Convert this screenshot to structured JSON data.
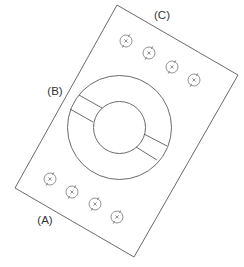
{
  "diagram": {
    "colors": {
      "line": "#5a5a5a",
      "label": "#333333",
      "background": "#ffffff"
    },
    "plate": {
      "corners": [
        [
          117,
          5
        ],
        [
          238,
          75
        ],
        [
          134,
          257
        ],
        [
          15,
          188
        ]
      ]
    },
    "ring": {
      "center": [
        119.5,
        127.5
      ],
      "outer_radius": 52,
      "inner_radius": 26,
      "slots": [
        {
          "side": "upper-left",
          "lines": [
            [
              [
                79,
                95
              ],
              [
                102,
                108
              ]
            ],
            [
              [
                70,
                109
              ],
              [
                93,
                122
              ]
            ]
          ]
        },
        {
          "side": "lower-right",
          "lines": [
            [
              [
                144,
                134
              ],
              [
                167,
                146
              ]
            ],
            [
              [
                136,
                147
              ],
              [
                157,
                160
              ]
            ]
          ]
        }
      ]
    },
    "fasteners": {
      "radius": 6,
      "row_c": [
        [
          126,
          41
        ],
        [
          149,
          53
        ],
        [
          172,
          67
        ],
        [
          194,
          80
        ]
      ],
      "row_a": [
        [
          50,
          179
        ],
        [
          72,
          192
        ],
        [
          95,
          204
        ],
        [
          117,
          217
        ]
      ]
    },
    "labels": [
      {
        "id": "A",
        "text": "(A)",
        "x": 45,
        "y": 221
      },
      {
        "id": "B",
        "text": "(B)",
        "x": 55,
        "y": 92
      },
      {
        "id": "C",
        "text": "(C)",
        "x": 162,
        "y": 16
      }
    ]
  }
}
